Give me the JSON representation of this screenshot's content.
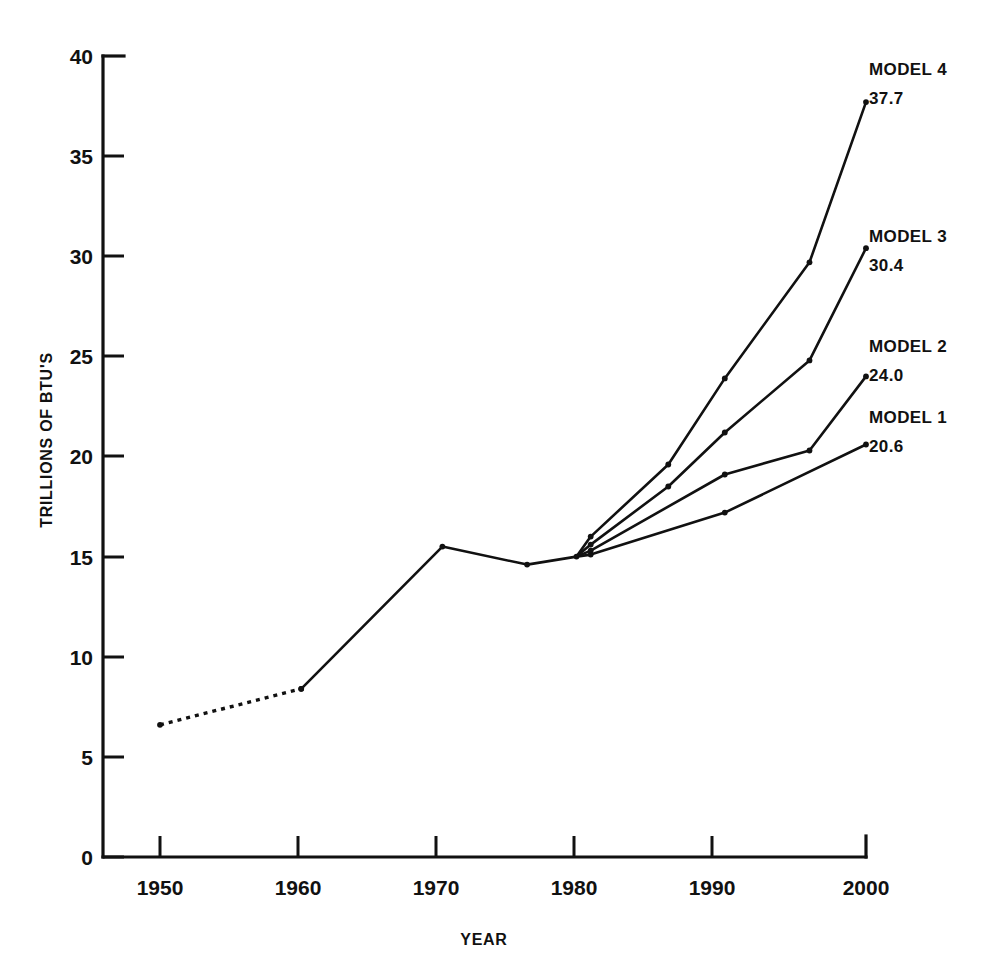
{
  "chart_data": {
    "type": "line",
    "title": "",
    "xlabel": "YEAR",
    "ylabel": "TRILLIONS OF BTU'S",
    "xlim": [
      1945,
      2002
    ],
    "ylim": [
      0,
      40
    ],
    "xticks": [
      1950,
      1960,
      1970,
      1980,
      1990,
      2000
    ],
    "xtick_labels": [
      "1950",
      "1960",
      "1970",
      "1980",
      "1990",
      "2000"
    ],
    "yticks": [
      0,
      5,
      10,
      15,
      20,
      25,
      30,
      35,
      40
    ],
    "ytick_labels": [
      "0",
      "5",
      "10",
      "15",
      "20",
      "25",
      "30",
      "35",
      "40"
    ],
    "grid": false,
    "legend_position": "right-inline-end-labels",
    "series": [
      {
        "name": "HISTORICAL (ESTIMATED)",
        "style": "dotted",
        "x": [
          1950,
          1960
        ],
        "values": [
          6.6,
          8.4
        ]
      },
      {
        "name": "HISTORICAL",
        "style": "solid",
        "x": [
          1960,
          1970,
          1976,
          1979.5
        ],
        "values": [
          8.4,
          15.5,
          14.6,
          15.0
        ]
      },
      {
        "name": "MODEL 1",
        "style": "solid",
        "end_label": "MODEL 1",
        "end_value_label": "20.6",
        "x": [
          1979.5,
          1980.5,
          1990,
          2000
        ],
        "values": [
          15.0,
          15.1,
          17.2,
          20.6
        ]
      },
      {
        "name": "MODEL 2",
        "style": "solid",
        "end_label": "MODEL 2",
        "end_value_label": "24.0",
        "x": [
          1979.5,
          1980.5,
          1990,
          1996,
          2000
        ],
        "values": [
          15.0,
          15.3,
          19.1,
          20.3,
          24.0
        ]
      },
      {
        "name": "MODEL 3",
        "style": "solid",
        "end_label": "MODEL 3",
        "end_value_label": "30.4",
        "x": [
          1979.5,
          1980.5,
          1986,
          1990,
          1996,
          2000
        ],
        "values": [
          15.0,
          15.6,
          18.5,
          21.2,
          24.8,
          30.4
        ]
      },
      {
        "name": "MODEL 4",
        "style": "solid",
        "end_label": "MODEL 4",
        "end_value_label": "37.7",
        "x": [
          1979.5,
          1980.5,
          1986,
          1990,
          1996,
          2000
        ],
        "values": [
          15.0,
          16.0,
          19.6,
          23.9,
          29.7,
          37.7
        ]
      }
    ],
    "annotations": [
      {
        "id": "model4",
        "label": "MODEL 4",
        "value": "37.7",
        "x": 869,
        "y": 75
      },
      {
        "id": "model3",
        "label": "MODEL 3",
        "value": "30.4",
        "x": 869,
        "y": 242
      },
      {
        "id": "model2",
        "label": "MODEL 2",
        "value": "24.0",
        "x": 869,
        "y": 352
      },
      {
        "id": "model1",
        "label": "MODEL 1",
        "value": "20.6",
        "x": 869,
        "y": 423
      }
    ]
  },
  "colors": {
    "ink": "#111111",
    "background": "#ffffff"
  }
}
